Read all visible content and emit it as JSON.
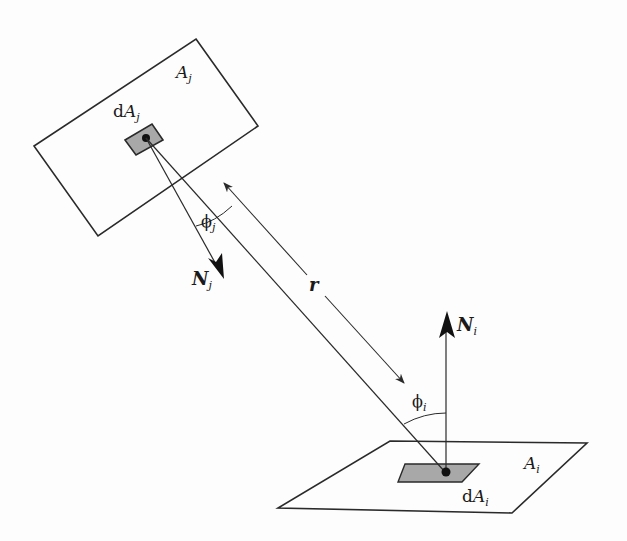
{
  "diagram": {
    "surfaces": {
      "A_j": {
        "label_main": "A",
        "label_sub": "j"
      },
      "dA_j": {
        "label_prefix": "d",
        "label_main": "A",
        "label_sub": "j"
      },
      "A_i": {
        "label_main": "A",
        "label_sub": "i"
      },
      "dA_i": {
        "label_prefix": "d",
        "label_main": "A",
        "label_sub": "i"
      }
    },
    "normals": {
      "N_j": {
        "label_main": "N",
        "label_sub": "j"
      },
      "N_i": {
        "label_main": "N",
        "label_sub": "i"
      }
    },
    "angles": {
      "phi_j": {
        "symbol": "ϕ",
        "sub": "j"
      },
      "phi_i": {
        "symbol": "ϕ",
        "sub": "i"
      }
    },
    "distance": {
      "label": "r"
    },
    "colors": {
      "line": "#2a2a2a",
      "patch_fill": "#a8a8a8",
      "background": "#fdfdfd"
    }
  }
}
